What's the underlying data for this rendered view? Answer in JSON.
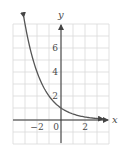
{
  "chart_data": {
    "type": "line",
    "title": "",
    "xlabel": "x",
    "ylabel": "y",
    "xlim": [
      -4,
      4
    ],
    "ylim": [
      -2,
      8
    ],
    "grid": true,
    "grid_step": 1,
    "x_ticks": [
      {
        "value": -2,
        "label": "−2"
      },
      {
        "value": 0,
        "label": "0"
      },
      {
        "value": 2,
        "label": "2"
      }
    ],
    "y_ticks": [
      {
        "value": 2,
        "label": "2"
      },
      {
        "value": 4,
        "label": "4"
      },
      {
        "value": 6,
        "label": "6"
      }
    ],
    "series": [
      {
        "name": "y = (1/2)^x",
        "x": [
          -3.1,
          -3,
          -2.5,
          -2,
          -1.5,
          -1,
          -0.5,
          0,
          0.5,
          1,
          1.5,
          2,
          2.5,
          3,
          3.5
        ],
        "values": [
          8.57,
          8,
          5.66,
          4,
          2.83,
          2,
          1.41,
          1,
          0.71,
          0.5,
          0.35,
          0.25,
          0.18,
          0.125,
          0.09
        ],
        "arrows_both_ends": true
      }
    ],
    "legend": null
  },
  "colors": {
    "grid": "#d9d9d9",
    "axis": "#333333",
    "curve": "#555555",
    "text": "#4a4a4a"
  }
}
